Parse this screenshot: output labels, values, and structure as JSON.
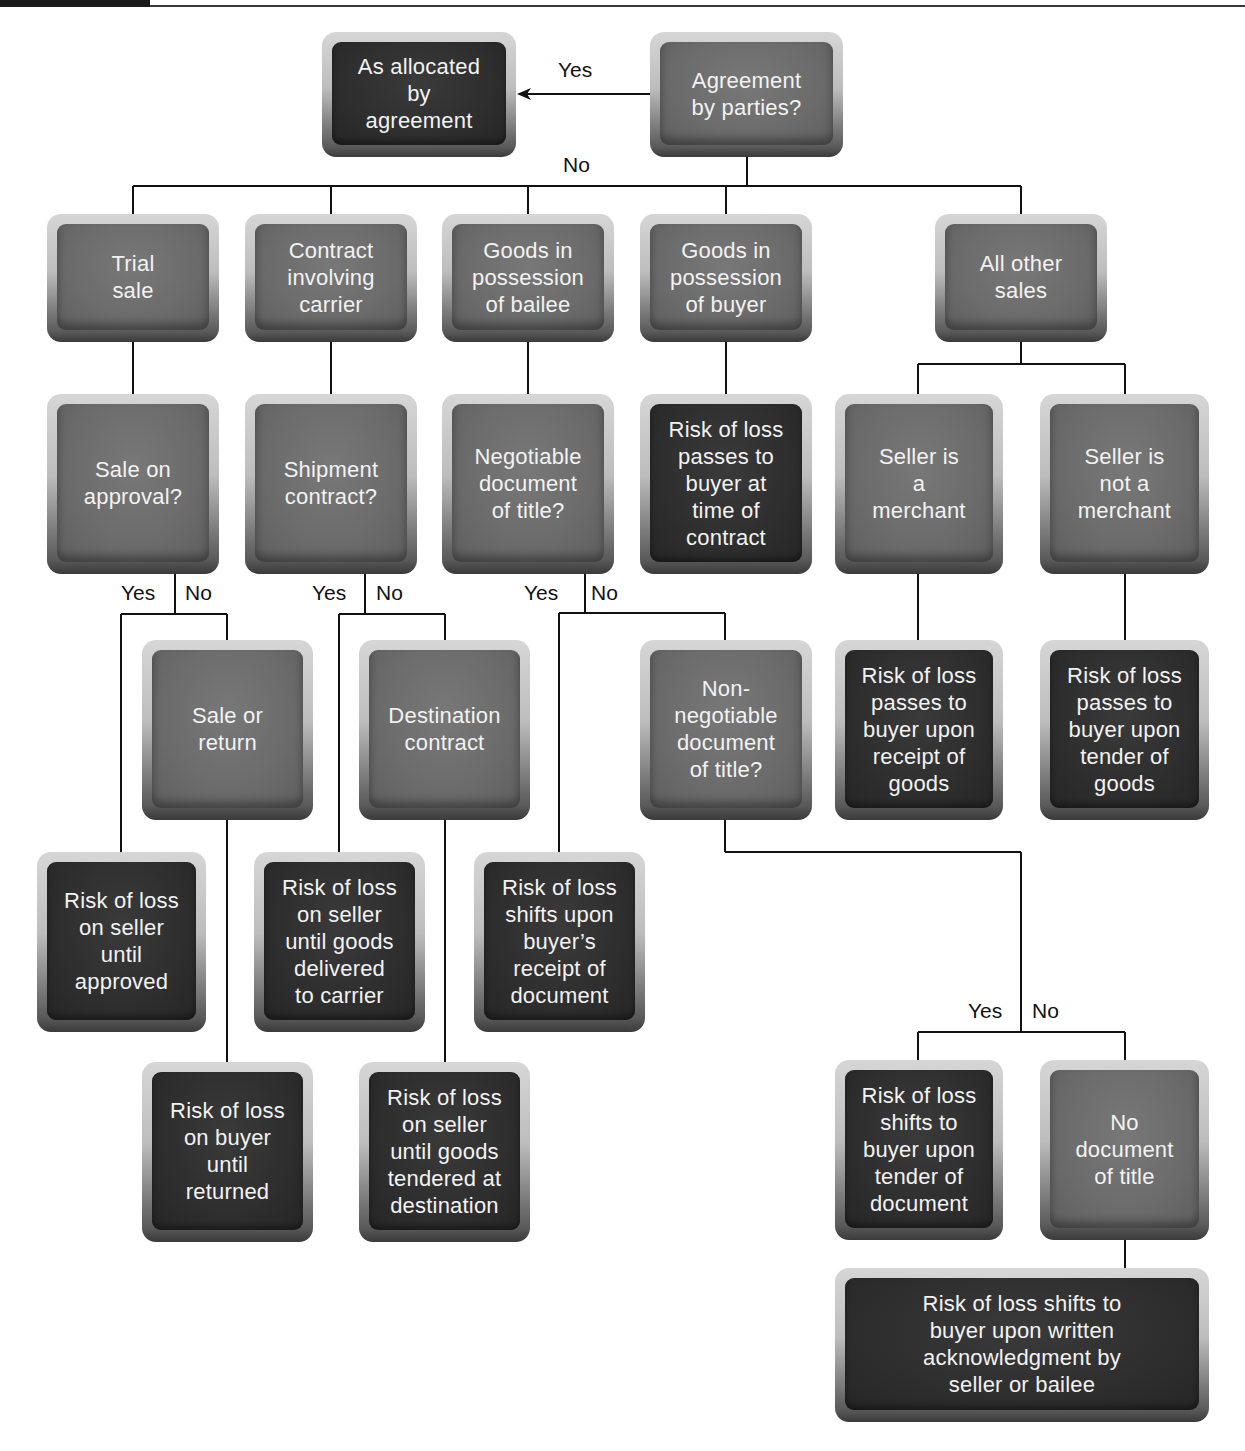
{
  "header": {
    "rule": true
  },
  "nodes": {
    "as_allocated": {
      "text": "As allocated\nby\nagreement",
      "kind": "outcome"
    },
    "agreement": {
      "text": "Agreement\nby parties?",
      "kind": "decision"
    },
    "trial_sale": {
      "text": "Trial\nsale",
      "kind": "decision"
    },
    "contract_carrier": {
      "text": "Contract\ninvolving\ncarrier",
      "kind": "decision"
    },
    "goods_bailee": {
      "text": "Goods in\npossession\nof bailee",
      "kind": "decision"
    },
    "goods_buyer": {
      "text": "Goods in\npossession\nof buyer",
      "kind": "decision"
    },
    "all_other": {
      "text": "All other\nsales",
      "kind": "decision"
    },
    "sale_on_approval": {
      "text": "Sale on\napproval?",
      "kind": "decision"
    },
    "shipment_contract": {
      "text": "Shipment\ncontract?",
      "kind": "decision"
    },
    "negotiable_doc": {
      "text": "Negotiable\ndocument\nof title?",
      "kind": "decision"
    },
    "risk_time_contract": {
      "text": "Risk of loss\npasses to\nbuyer at\ntime of\ncontract",
      "kind": "outcome"
    },
    "seller_merchant": {
      "text": "Seller is\na\nmerchant",
      "kind": "decision"
    },
    "seller_not_merchant": {
      "text": "Seller is\nnot a\nmerchant",
      "kind": "decision"
    },
    "sale_or_return": {
      "text": "Sale or\nreturn",
      "kind": "decision"
    },
    "destination_contract": {
      "text": "Destination\ncontract",
      "kind": "decision"
    },
    "non_negotiable_doc": {
      "text": "Non-\nnegotiable\ndocument\nof title?",
      "kind": "decision"
    },
    "risk_receipt_goods": {
      "text": "Risk of loss\npasses to\nbuyer upon\nreceipt of\ngoods",
      "kind": "outcome"
    },
    "risk_tender_goods": {
      "text": "Risk of loss\npasses to\nbuyer upon\ntender of\ngoods",
      "kind": "outcome"
    },
    "risk_until_approved": {
      "text": "Risk of loss\non seller\nuntil\napproved",
      "kind": "outcome"
    },
    "risk_delivered_carrier": {
      "text": "Risk of loss\non seller\nuntil goods\ndelivered\nto carrier",
      "kind": "outcome"
    },
    "risk_receipt_document": {
      "text": "Risk of loss\nshifts upon\nbuyer’s\nreceipt of\ndocument",
      "kind": "outcome"
    },
    "risk_until_returned": {
      "text": "Risk of loss\non buyer\nuntil\nreturned",
      "kind": "outcome"
    },
    "risk_tendered_destination": {
      "text": "Risk of loss\non seller\nuntil goods\ntendered at\ndestination",
      "kind": "outcome"
    },
    "risk_tender_document": {
      "text": "Risk of loss\nshifts to\nbuyer upon\ntender of\ndocument",
      "kind": "outcome"
    },
    "no_document": {
      "text": "No\ndocument\nof title",
      "kind": "decision"
    },
    "risk_written_ack": {
      "text": "Risk of loss shifts to\nbuyer upon written\nacknowledgment by\nseller or bailee",
      "kind": "outcome"
    }
  },
  "labels": {
    "top_yes": "Yes",
    "top_no": "No",
    "approval_yes": "Yes",
    "approval_no": "No",
    "shipment_yes": "Yes",
    "shipment_no": "No",
    "negotiable_yes": "Yes",
    "negotiable_no": "No",
    "nonneg_yes": "Yes",
    "nonneg_no": "No"
  },
  "colors": {
    "decision_face": "#6e6e6e",
    "outcome_face": "#2e2e2e",
    "text": "#f2f2f2",
    "line": "#111111"
  }
}
